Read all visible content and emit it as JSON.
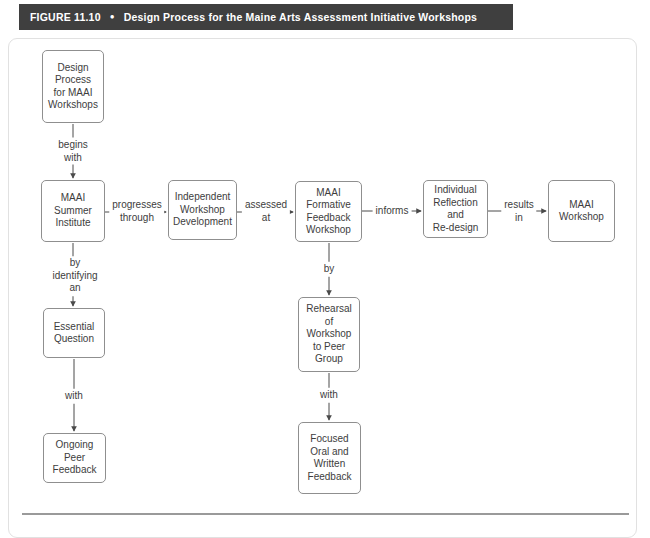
{
  "figure_header": {
    "label": "FIGURE 11.10",
    "bullet": "●",
    "title": "Design Process for the Maine Arts Assessment Initiative Workshops"
  },
  "flowchart": {
    "nodes": [
      {
        "id": "design-process",
        "text": "Design\nProcess\nfor MAAI\nWorkshops"
      },
      {
        "id": "maai-summer-institute",
        "text": "MAAI\nSummer\nInstitute"
      },
      {
        "id": "independent-workshop-development",
        "text": "Independent\nWorkshop\nDevelopment"
      },
      {
        "id": "maai-formative-feedback-workshop",
        "text": "MAAI\nFormative\nFeedback\nWorkshop"
      },
      {
        "id": "individual-reflection-redesign",
        "text": "Individual\nReflection\nand\nRe-design"
      },
      {
        "id": "maai-workshop",
        "text": "MAAI\nWorkshop"
      },
      {
        "id": "essential-question",
        "text": "Essential\nQuestion"
      },
      {
        "id": "ongoing-peer-feedback",
        "text": "Ongoing\nPeer\nFeedback"
      },
      {
        "id": "rehearsal-workshop-peer-group",
        "text": "Rehearsal\nof\nWorkshop\nto Peer\nGroup"
      },
      {
        "id": "focused-oral-written-feedback",
        "text": "Focused\nOral and\nWritten\nFeedback"
      }
    ],
    "edges": [
      {
        "from": "design-process",
        "to": "maai-summer-institute",
        "label": "begins\nwith"
      },
      {
        "from": "maai-summer-institute",
        "to": "independent-workshop-development",
        "label": "progresses\nthrough"
      },
      {
        "from": "independent-workshop-development",
        "to": "maai-formative-feedback-workshop",
        "label": "assessed\nat"
      },
      {
        "from": "maai-formative-feedback-workshop",
        "to": "individual-reflection-redesign",
        "label": "informs"
      },
      {
        "from": "individual-reflection-redesign",
        "to": "maai-workshop",
        "label": "results\nin"
      },
      {
        "from": "maai-summer-institute",
        "to": "essential-question",
        "label": "by\nidentifying\nan"
      },
      {
        "from": "essential-question",
        "to": "ongoing-peer-feedback",
        "label": "with"
      },
      {
        "from": "maai-formative-feedback-workshop",
        "to": "rehearsal-workshop-peer-group",
        "label": "by"
      },
      {
        "from": "rehearsal-workshop-peer-group",
        "to": "focused-oral-written-feedback",
        "label": "with"
      }
    ]
  },
  "colors": {
    "header_bg": "#3f3f3f",
    "header_text": "#ffffff",
    "node_border": "#8f8f8f",
    "node_text": "#3d3d3d",
    "arrow": "#4a4a4a",
    "figure_border": "#e1e1e1",
    "bottom_rule": "#9a9a9a"
  }
}
